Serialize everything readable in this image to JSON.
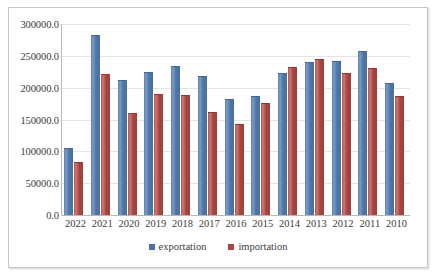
{
  "chart_data": {
    "type": "bar",
    "title": "",
    "xlabel": "",
    "ylabel": "",
    "grid": true,
    "legend_position": "bottom",
    "ylim": [
      0,
      300000
    ],
    "y_ticks": [
      0,
      50000,
      100000,
      150000,
      200000,
      250000,
      300000
    ],
    "y_tick_labels": [
      "0.0",
      "50000.0",
      "100000.0",
      "150000.0",
      "200000.0",
      "250000.0",
      "300000.0"
    ],
    "categories": [
      "2022",
      "2021",
      "2020",
      "2019",
      "2018",
      "2017",
      "2016",
      "2015",
      "2014",
      "2013",
      "2012",
      "2011",
      "2010"
    ],
    "series": [
      {
        "name": "exportation",
        "color": "#4572A7",
        "values": [
          103000,
          281000,
          210000,
          223000,
          232000,
          216000,
          181000,
          186000,
          222000,
          238000,
          241000,
          256000,
          205000
        ]
      },
      {
        "name": "importation",
        "color": "#AA4643",
        "values": [
          82000,
          220000,
          159000,
          188000,
          187000,
          160000,
          142000,
          175000,
          231000,
          243000,
          221000,
          230000,
          185000
        ]
      }
    ]
  },
  "legend": {
    "items": [
      {
        "label": "exportation",
        "color": "#4572A7"
      },
      {
        "label": "importation",
        "color": "#AA4643"
      }
    ]
  },
  "colors": {
    "exportation": "#4572A7",
    "importation": "#AA4643",
    "gridline": "#E4E4E4",
    "axis": "#B7B7B7",
    "text": "#3B3B3B",
    "frame_border": "#C8C8C8",
    "background": "#FFFFFF"
  }
}
